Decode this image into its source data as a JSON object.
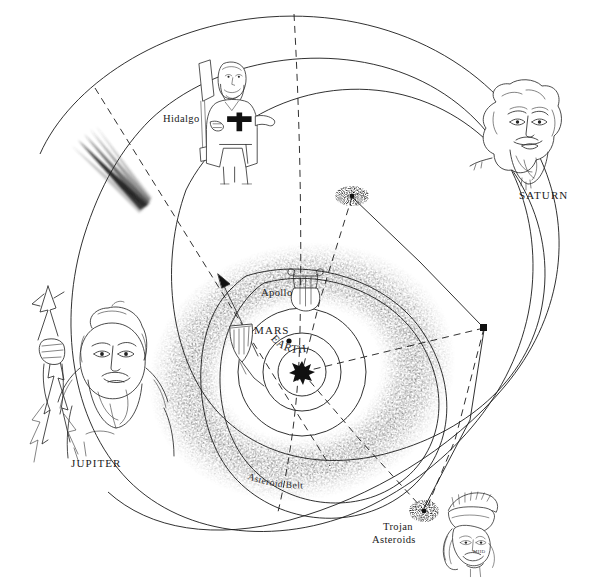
{
  "diagram": {
    "background_color": "#ffffff",
    "ink_color": "#1a1a1a",
    "width": 594,
    "height": 583
  },
  "labels": {
    "hidalgo": "Hidalgo",
    "saturn": "SATURN",
    "jupiter": "JUPITER",
    "apollo": "Apollo",
    "mars": "MARS",
    "earth": "EARTH",
    "asteroid_belt": "Asteroid Belt",
    "trojan_asteroids_line1": "Trojan",
    "trojan_asteroids_line2": "Asteroids",
    "artist_signature": "MHD"
  },
  "figures": [
    {
      "id": "hidalgo-figure",
      "name": "Hidalgo",
      "description": "bearded priest holding banner staff with cross",
      "label": "Hidalgo",
      "label_x": 163,
      "label_y": 119,
      "x": 185,
      "y": 55
    },
    {
      "id": "saturn-figure",
      "name": "SATURN",
      "description": "bearded elder head",
      "label": "SATURN",
      "label_x": 520,
      "label_y": 196,
      "x": 468,
      "y": 78
    },
    {
      "id": "jupiter-figure",
      "name": "JUPITER",
      "description": "bearded head with hand holding lightning bolt",
      "label": "JUPITER",
      "label_x": 72,
      "label_y": 464,
      "x": 12,
      "y": 282
    },
    {
      "id": "apollo-figure",
      "name": "Apollo",
      "description": "lyre",
      "label": "Apollo",
      "label_x": 264,
      "label_y": 296,
      "x": 288,
      "y": 270
    },
    {
      "id": "mars-figure",
      "name": "MARS",
      "description": "spear and shield",
      "label": "MARS",
      "label_x": 258,
      "label_y": 331,
      "x": 215,
      "y": 272
    },
    {
      "id": "trojan-figure",
      "name": "Trojan Asteroids",
      "description": "trojan warrior head with plumed helmet",
      "label": "Trojan Asteroids",
      "label_x": 384,
      "label_y": 535,
      "x": 432,
      "y": 495
    }
  ],
  "bodies": [
    {
      "id": "sun",
      "name": "Sun",
      "x": 302,
      "y": 372,
      "style": "starburst"
    },
    {
      "id": "earth",
      "name": "EARTH",
      "x": 289,
      "y": 341,
      "style": "dot",
      "label": "EARTH"
    },
    {
      "id": "marker-upper-right",
      "name": "asteroid-cluster-upper",
      "x": 352,
      "y": 196,
      "style": "stipple-cluster"
    },
    {
      "id": "marker-right",
      "name": "asteroid-marker-right",
      "x": 484,
      "y": 328,
      "style": "solid-square"
    },
    {
      "id": "marker-trojan",
      "name": "trojan-cluster",
      "x": 424,
      "y": 511,
      "style": "stipple-cluster"
    },
    {
      "id": "comet",
      "name": "comet",
      "x": 110,
      "y": 170,
      "style": "comet-streak"
    }
  ],
  "orbits": [
    {
      "id": "saturn-orbit",
      "name": "Saturn orbit",
      "type": "solid",
      "description": "outermost large ellipse"
    },
    {
      "id": "jupiter-orbit",
      "name": "Jupiter orbit",
      "type": "solid",
      "description": "large ellipse"
    },
    {
      "id": "hidalgo-orbit",
      "name": "Hidalgo orbit",
      "type": "solid",
      "description": "highly eccentric ellipse reaching Saturn"
    },
    {
      "id": "asteroid-belt-orbit",
      "name": "Asteroid belt band",
      "type": "stippled",
      "description": "stippled torus between Mars and Jupiter"
    },
    {
      "id": "apollo-orbit",
      "name": "Apollo orbit",
      "type": "solid",
      "description": "eccentric ellipse crossing Earth orbit"
    },
    {
      "id": "mars-orbit",
      "name": "Mars orbit",
      "type": "solid",
      "description": "circle"
    },
    {
      "id": "earth-orbit",
      "name": "Earth orbit",
      "type": "solid",
      "description": "inner circle"
    },
    {
      "id": "comet-path",
      "name": "Comet path",
      "type": "dashed",
      "description": "long dashed hyperbolic trajectory from upper left"
    },
    {
      "id": "trojan-path-1",
      "name": "Trojan leading path",
      "type": "dashed",
      "description": "dashed line to Trojan point"
    },
    {
      "id": "trojan-path-2",
      "name": "Trojan trailing path",
      "type": "dashed",
      "description": "dashed line to right marker"
    }
  ]
}
